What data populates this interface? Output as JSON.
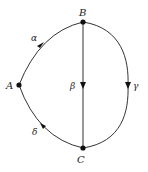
{
  "diagram": {
    "type": "directed multigraph",
    "vertices": [
      {
        "id": "A",
        "label": "A",
        "x": 19,
        "y": 85
      },
      {
        "id": "B",
        "label": "B",
        "x": 83,
        "y": 22
      },
      {
        "id": "C",
        "label": "C",
        "x": 83,
        "y": 148
      }
    ],
    "edges": [
      {
        "id": "alpha",
        "label": "α",
        "from": "A",
        "to": "B",
        "shape": "curve-left-upper"
      },
      {
        "id": "beta",
        "label": "β",
        "from": "B",
        "to": "C",
        "shape": "straight"
      },
      {
        "id": "gamma",
        "label": "γ",
        "from": "B",
        "to": "C",
        "shape": "curve-right"
      },
      {
        "id": "delta",
        "label": "δ",
        "from": "C",
        "to": "A",
        "shape": "curve-left-lower"
      }
    ],
    "colors": {
      "line": "#333333",
      "vertex": "#111111",
      "text": "#222222"
    }
  }
}
